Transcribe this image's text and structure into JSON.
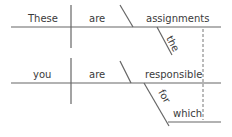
{
  "diagram": {
    "type": "sentence-diagram",
    "clauses": [
      {
        "subject": "These",
        "verb": "are",
        "complement": "assignments",
        "modifiers": [
          {
            "word": "the",
            "modifies": "assignments"
          }
        ]
      },
      {
        "subject": "you",
        "verb": "are",
        "complement": "responsible",
        "modifiers": [
          {
            "word": "for",
            "type": "preposition",
            "object": "which"
          }
        ]
      }
    ],
    "connector": {
      "from": "assignments",
      "to": "which",
      "style": "dashed"
    }
  },
  "words": {
    "w1": "These",
    "w2": "are",
    "w3": "assignments",
    "w4": "the",
    "w5": "you",
    "w6": "are",
    "w7": "responsible",
    "w8": "for",
    "w9": "which"
  },
  "colors": {
    "line": "#666666",
    "text": "#3a3a3a",
    "background": "#ffffff"
  }
}
